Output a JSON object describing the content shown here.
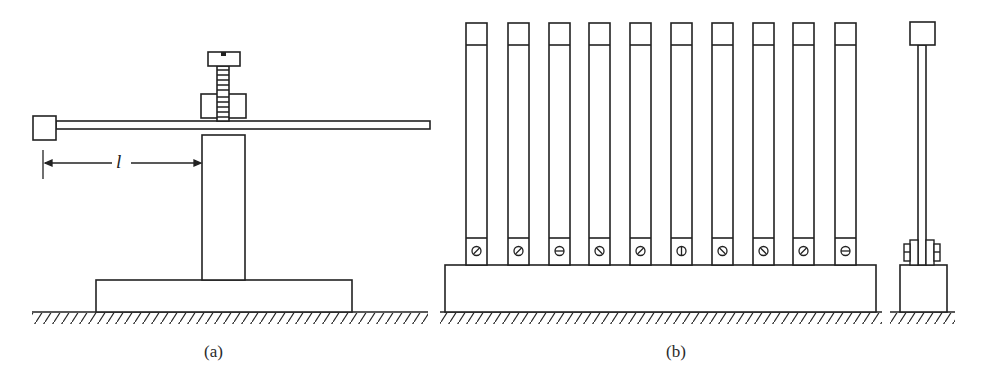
{
  "figure": {
    "panels": [
      {
        "id": "a",
        "caption": "(a)",
        "description": "Cantilever rod clamped by a screw on a post, with end mass",
        "dimension_label": "l"
      },
      {
        "id": "b",
        "caption": "(b)",
        "description": "Row of ten vertical reeds of varying length clamped with screws onto a common base, with side view",
        "reed_count": 10,
        "screw_slot_angles_deg": [
          -45,
          -45,
          0,
          45,
          -45,
          90,
          45,
          45,
          -45,
          0
        ]
      }
    ],
    "colors": {
      "line": "#222222",
      "background": "#ffffff"
    }
  }
}
